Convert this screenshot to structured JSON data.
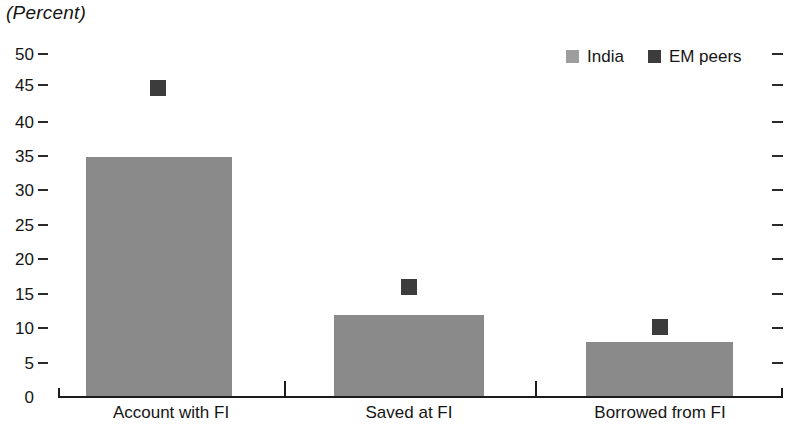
{
  "chart_data": {
    "type": "bar",
    "title": "(Percent)",
    "xlabel": "",
    "ylabel": "",
    "ylim": [
      0,
      50
    ],
    "ytick_step": 5,
    "ytick_labels": [
      "50",
      "45",
      "40",
      "35",
      "30",
      "25",
      "20",
      "15",
      "10",
      "5",
      "0"
    ],
    "grid": false,
    "legend_position": "top-right",
    "categories": [
      "Account with FI",
      "Saved at FI",
      "Borrowed from FI"
    ],
    "series": [
      {
        "name": "India",
        "render": "bar",
        "color": "#8a8a8a",
        "values": [
          35,
          12,
          8
        ]
      },
      {
        "name": "EM peers",
        "render": "square-marker",
        "color": "#3c3c3c",
        "values": [
          45,
          16,
          10.2
        ]
      }
    ]
  },
  "legend": {
    "entries": [
      {
        "label": "India",
        "color": "#8a8a8a"
      },
      {
        "label": "EM peers",
        "color": "#3c3c3c"
      }
    ]
  },
  "axis": {
    "right_tick_values": [
      50,
      45,
      40,
      35,
      30,
      25,
      20,
      15,
      10,
      5
    ]
  }
}
